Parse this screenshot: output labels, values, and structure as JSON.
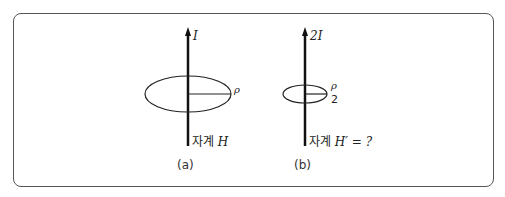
{
  "figure": {
    "a": {
      "current": "I",
      "radius": "ρ",
      "field_prefix": "자계",
      "field": "H",
      "caption": "(a)"
    },
    "b": {
      "current": "2I",
      "radius_num": "ρ",
      "radius_den": "2",
      "field_prefix": "자계",
      "field": "H′ = ?",
      "caption": "(b)"
    }
  }
}
